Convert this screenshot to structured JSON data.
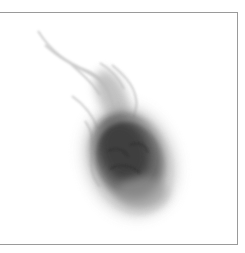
{
  "image": {
    "subject": "flagellated protozoan micrograph",
    "background_color": "#ffffff",
    "frame_color": "#9a9a9a",
    "cell_core_color": "#3a3a3a",
    "cell_halo_color": "#bdbdbd",
    "flagella_color": "#c8c8c8"
  }
}
